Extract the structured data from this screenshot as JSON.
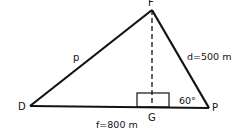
{
  "diagram": {
    "type": "triangle",
    "vertices": {
      "F": "F",
      "D": "D",
      "P": "P",
      "G": "G"
    },
    "labels": {
      "side_DF": "p",
      "side_FP": "d=500  m",
      "side_DP": "f=800  m",
      "angle_P": "60°"
    },
    "colors": {
      "line": "#111111",
      "background": "#ffffff"
    }
  }
}
